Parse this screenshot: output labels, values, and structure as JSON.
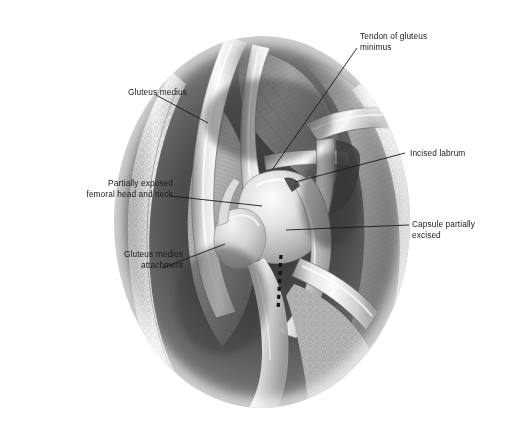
{
  "figure": {
    "background_color": "#ffffff",
    "ink_color": "#1a1a1a",
    "width": 518,
    "height": 444
  },
  "labels": [
    {
      "id": "tendon-gluteus-minimus",
      "text": "Tendon of gluteus\nminimus",
      "align": "left",
      "x": 360,
      "y": 31,
      "leader": "M357,48 L272,170"
    },
    {
      "id": "gluteus-medius",
      "text": "Gluteus medius",
      "align": "right",
      "x": 62,
      "y": 87,
      "leader": "M156,95 L208,123"
    },
    {
      "id": "incised-labrum",
      "text": "Incised labrum",
      "align": "left",
      "x": 410,
      "y": 148,
      "leader": "M405,153 L295,182"
    },
    {
      "id": "partially-exposed-femoral-head-and-neck",
      "text": "Partially exposed\nfemoral head and neck",
      "align": "right",
      "x": 48,
      "y": 178,
      "leader": "M170,196 L262,206"
    },
    {
      "id": "capsule-partially-excised",
      "text": "Capsule partially\nexcised",
      "align": "left",
      "x": 412,
      "y": 219,
      "leader": "M409,225 L286,230"
    },
    {
      "id": "gluteus-medius-attachment",
      "text": "Gluteus medius\nattachment",
      "align": "right",
      "x": 58,
      "y": 249,
      "leader": "M162,268 L225,244"
    }
  ],
  "annotations": {
    "dashed_incision_line": {
      "name": "dashed-incision-guide",
      "path": "M281,255 L278,310",
      "dash": "4 4",
      "color": "#141414",
      "width": 3.2
    }
  },
  "anatomy": {
    "wound_edges": "everted skin and subcutaneous fat margins",
    "retractors": "three curved retractor blades and one angled hook retractor",
    "structures": [
      "gluteus medius muscle belly",
      "gluteus minimus tendon",
      "femoral head",
      "femoral neck",
      "acetabular labrum (incised)",
      "joint capsule (partially excised)"
    ]
  }
}
